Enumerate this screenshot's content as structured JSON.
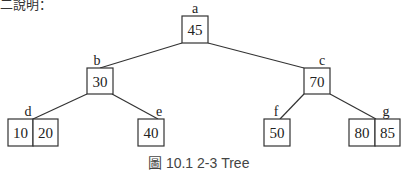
{
  "header_partial_text": "二說明：",
  "caption": "圖 10.1  2-3 Tree",
  "tree": {
    "nodes": [
      {
        "id": "a",
        "keys": [
          "45"
        ]
      },
      {
        "id": "b",
        "keys": [
          "30"
        ]
      },
      {
        "id": "c",
        "keys": [
          "70"
        ]
      },
      {
        "id": "d",
        "keys": [
          "10",
          "20"
        ]
      },
      {
        "id": "e",
        "keys": [
          "40"
        ]
      },
      {
        "id": "f",
        "keys": [
          "50"
        ]
      },
      {
        "id": "g",
        "keys": [
          "80",
          "85"
        ]
      }
    ],
    "edges": [
      [
        "a",
        "b"
      ],
      [
        "a",
        "c"
      ],
      [
        "b",
        "d"
      ],
      [
        "b",
        "e"
      ],
      [
        "c",
        "f"
      ],
      [
        "c",
        "g"
      ]
    ]
  },
  "labels": {
    "a": "a",
    "b": "b",
    "c": "c",
    "d": "d",
    "e": "e",
    "f": "f",
    "g": "g"
  },
  "keys": {
    "a0": "45",
    "b0": "30",
    "c0": "70",
    "d0": "10",
    "d1": "20",
    "e0": "40",
    "f0": "50",
    "g0": "80",
    "g1": "85"
  }
}
